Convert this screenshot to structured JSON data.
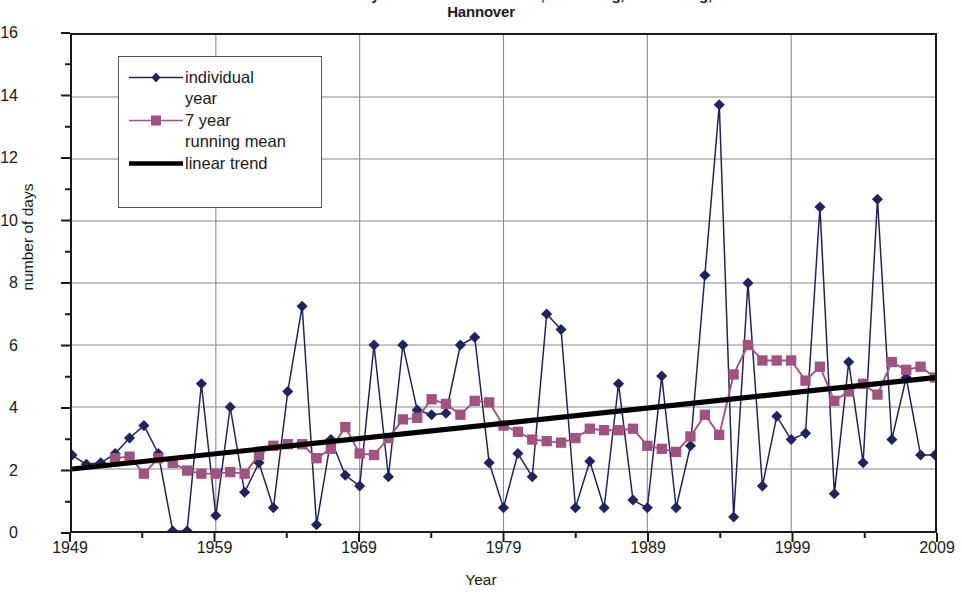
{
  "chart_data": {
    "type": "line",
    "title": "Northern Germany in summer: Greifswald, Schleswig, Lindenberg, Hannover",
    "title_line1": "Northern Germany in summer: Greifswald, Schleswig, Lindenberg,",
    "title_line2": "Hannover",
    "xlabel": "Year",
    "ylabel": "number of days",
    "xlim": [
      1949,
      2009
    ],
    "ylim": [
      0,
      16
    ],
    "ytick_step": 2,
    "yminor_step": 1,
    "xtick_step": 10,
    "xminor_step": 5,
    "grid": true,
    "legend_position": "upper left inside",
    "ytick_labels": [
      "0",
      "2",
      "4",
      "6",
      "8",
      "10",
      "12",
      "14",
      "16"
    ],
    "xtick_labels": [
      "1949",
      "1959",
      "1969",
      "1979",
      "1989",
      "1999",
      "2009"
    ],
    "colors": {
      "individual_year": "#21225e",
      "running_mean": "#a0537e",
      "linear_trend": "#000000",
      "grid": "#8a8a8a",
      "axis": "#1a1a1a",
      "background": "#ffffff"
    },
    "x": [
      1949,
      1950,
      1951,
      1952,
      1953,
      1954,
      1955,
      1956,
      1957,
      1958,
      1959,
      1960,
      1961,
      1962,
      1963,
      1964,
      1965,
      1966,
      1967,
      1968,
      1969,
      1970,
      1971,
      1972,
      1973,
      1974,
      1975,
      1976,
      1977,
      1978,
      1979,
      1980,
      1981,
      1982,
      1983,
      1984,
      1985,
      1986,
      1987,
      1988,
      1989,
      1990,
      1991,
      1992,
      1993,
      1994,
      1995,
      1996,
      1997,
      1998,
      1999,
      2000,
      2001,
      2002,
      2003,
      2004,
      2005,
      2006,
      2007,
      2008,
      2009
    ],
    "series": [
      {
        "name": "individual year",
        "marker": "diamond",
        "color": "#21225e",
        "values": [
          2.45,
          2.15,
          2.2,
          2.5,
          3.0,
          3.4,
          2.5,
          0.0,
          0.0,
          4.75,
          0.5,
          4.0,
          1.25,
          2.2,
          0.75,
          4.5,
          7.25,
          0.2,
          2.95,
          1.8,
          1.45,
          6.0,
          1.75,
          6.0,
          3.9,
          3.75,
          3.8,
          6.0,
          6.25,
          2.2,
          0.75,
          2.5,
          1.75,
          7.0,
          6.5,
          0.75,
          2.25,
          0.75,
          4.75,
          1.0,
          0.75,
          5.0,
          0.75,
          2.75,
          8.25,
          13.75,
          0.45,
          8.0,
          1.45,
          3.7,
          2.95,
          3.15,
          10.45,
          1.2,
          5.45,
          2.2,
          10.7,
          2.95,
          4.95,
          2.45,
          2.45
        ]
      },
      {
        "name": "7 year running mean",
        "marker": "square",
        "color": "#a0537e",
        "values": [
          null,
          null,
          null,
          2.35,
          2.4,
          1.85,
          2.35,
          2.2,
          1.95,
          1.85,
          1.85,
          1.9,
          1.85,
          2.45,
          2.75,
          2.8,
          2.8,
          2.35,
          2.65,
          3.35,
          2.5,
          2.45,
          3.0,
          3.6,
          3.65,
          4.25,
          4.1,
          3.75,
          4.2,
          4.15,
          3.4,
          3.2,
          2.95,
          2.9,
          2.85,
          3.0,
          3.3,
          3.25,
          3.25,
          3.3,
          2.75,
          2.65,
          2.55,
          3.05,
          3.75,
          3.1,
          5.05,
          6.0,
          5.5,
          5.5,
          5.5,
          4.85,
          5.3,
          4.2,
          4.5,
          4.75,
          4.4,
          5.45,
          5.2,
          5.3,
          4.95
        ]
      }
    ],
    "trend": {
      "name": "linear trend",
      "color": "#000000",
      "x_start": 1949,
      "y_start": 2.0,
      "x_end": 2009,
      "y_end": 4.95
    }
  },
  "legend": {
    "items": [
      {
        "label_line1": "individual",
        "label_line2": "year",
        "key": "line-diamond"
      },
      {
        "label_line1": "7 year",
        "label_line2": "running mean",
        "key": "line-square"
      },
      {
        "label_line1": "linear trend",
        "label_line2": "",
        "key": "thick-line"
      }
    ]
  }
}
